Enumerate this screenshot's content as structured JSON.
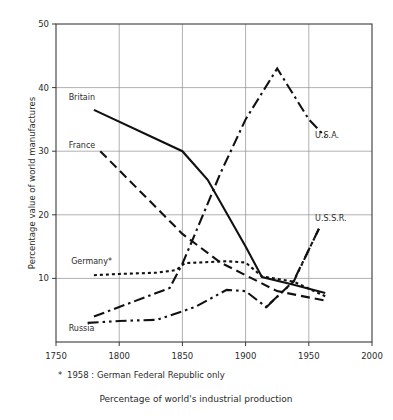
{
  "chart_data": {
    "type": "line",
    "title": "",
    "caption": "Percentage of world's industrial production",
    "footnote": "* 1958 : German Federal Republic only",
    "footnote_marker": "*",
    "xlabel": "",
    "ylabel": "Percentage value of world manufactures",
    "xlim": [
      1750,
      2000
    ],
    "ylim": [
      0,
      50
    ],
    "xticks": [
      1750,
      1800,
      1850,
      1900,
      1950,
      2000
    ],
    "xtick_labels": [
      "1750",
      "1800",
      "1850",
      "1900",
      "1950",
      "2000"
    ],
    "yticks": [
      10,
      20,
      30,
      40,
      50
    ],
    "ytick_labels": [
      "10",
      "20",
      "30",
      "40",
      "50"
    ],
    "grid": "both",
    "legend_position": "inline-labels",
    "series": [
      {
        "name": "Britain",
        "label": "Britain",
        "style": "solid",
        "label_x": 1760,
        "label_y": 38.0,
        "points": [
          [
            1780,
            36.5
          ],
          [
            1850,
            30.0
          ],
          [
            1870,
            25.5
          ],
          [
            1900,
            15.0
          ],
          [
            1913,
            10.2
          ],
          [
            1938,
            9.0
          ],
          [
            1963,
            7.7
          ]
        ]
      },
      {
        "name": "France",
        "label": "France",
        "style": "dashed",
        "label_x": 1760,
        "label_y": 30.5,
        "points": [
          [
            1785,
            30.0
          ],
          [
            1850,
            17.0
          ],
          [
            1880,
            12.5
          ],
          [
            1900,
            10.5
          ],
          [
            1925,
            8.0
          ],
          [
            1963,
            6.5
          ]
        ]
      },
      {
        "name": "Germany",
        "label": "Germany*",
        "style": "dotted",
        "label_x": 1762,
        "label_y": 12.2,
        "points": [
          [
            1780,
            10.5
          ],
          [
            1800,
            10.7
          ],
          [
            1830,
            10.9
          ],
          [
            1845,
            11.3
          ],
          [
            1852,
            12.4
          ],
          [
            1885,
            12.7
          ],
          [
            1900,
            12.5
          ],
          [
            1913,
            10.3
          ],
          [
            1938,
            9.5
          ],
          [
            1963,
            7.2
          ]
        ]
      },
      {
        "name": "Russia",
        "label": "Russia",
        "style": "dash-dot-dot",
        "label_x": 1760,
        "label_y": 1.8,
        "points": [
          [
            1775,
            3.0
          ],
          [
            1800,
            3.3
          ],
          [
            1830,
            3.5
          ],
          [
            1860,
            5.5
          ],
          [
            1885,
            8.2
          ],
          [
            1900,
            8.0
          ],
          [
            1913,
            6.0
          ],
          [
            1916,
            5.5
          ],
          [
            1938,
            9.5
          ],
          [
            1958,
            17.8
          ]
        ]
      },
      {
        "name": "U.S.A.",
        "label": "U.S.A.",
        "style": "dash-dot",
        "label_x": 1955,
        "label_y": 32.0,
        "points": [
          [
            1780,
            4.0
          ],
          [
            1840,
            8.5
          ],
          [
            1850,
            12.3
          ],
          [
            1860,
            17.0
          ],
          [
            1880,
            26.5
          ],
          [
            1900,
            35.0
          ],
          [
            1925,
            43.0
          ],
          [
            1950,
            35.0
          ],
          [
            1963,
            32.3
          ]
        ]
      },
      {
        "name": "U.S.S.R.",
        "label": "U.S.S.R.",
        "style": "dash-dot",
        "label_x": 1955,
        "label_y": 19.0,
        "points": [
          [
            1916,
            5.4
          ],
          [
            1938,
            9.6
          ],
          [
            1958,
            17.8
          ]
        ]
      }
    ],
    "annotations": [
      {
        "text": "U.S.A.",
        "x": 1955,
        "y": 32.0
      },
      {
        "text": "U.S.S.R.",
        "x": 1955,
        "y": 19.0
      }
    ]
  }
}
